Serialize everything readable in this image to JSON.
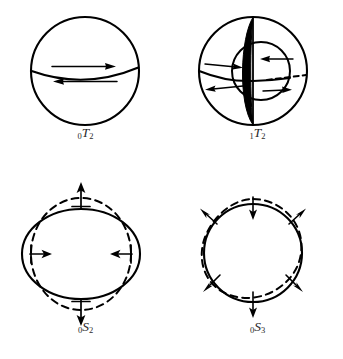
{
  "figure": {
    "background_color": "#ffffff",
    "stroke_color": "#000000",
    "label_color": "#2b2b2b",
    "width": 343,
    "height": 359
  },
  "panels": [
    {
      "id": "0T2",
      "mode_type": "toroidal",
      "overtone_number": "0",
      "symbol": "T",
      "angular_order": "2",
      "label_full": "₀T₂",
      "description": "Sphere with equatorial nodal line; upper hemisphere twists east, lower hemisphere twists west",
      "arrows": [
        {
          "name": "upper-hemisphere-arrow",
          "direction": "right"
        },
        {
          "name": "lower-hemisphere-arrow",
          "direction": "left"
        }
      ],
      "features": [
        "outer-sphere-outline",
        "equator-curve"
      ]
    },
    {
      "id": "1T2",
      "mode_type": "toroidal",
      "overtone_number": "1",
      "symbol": "T",
      "angular_order": "2",
      "label_full": "₁T₂",
      "description": "Sphere with one internal nodal surface shown as black lune; outer shell and inner core twist in opposite senses",
      "arrows": [
        {
          "name": "outer-upper-arrow",
          "direction": "right"
        },
        {
          "name": "outer-lower-arrow",
          "direction": "left"
        },
        {
          "name": "inner-upper-arrow",
          "direction": "left"
        },
        {
          "name": "inner-lower-arrow",
          "direction": "right"
        }
      ],
      "features": [
        "outer-sphere-outline",
        "black-lune-nodal-surface",
        "inner-circle",
        "equator-curve",
        "hidden-equator-dashed"
      ]
    },
    {
      "id": "0S2",
      "mode_type": "spheroidal",
      "overtone_number": "0",
      "symbol": "S",
      "angular_order": "2",
      "label_full": "₀S₂",
      "description": "Football mode: solid oblate outline alternates with dashed prolate outline; motion outward at poles and inward at equator",
      "arrows": [
        {
          "name": "top-arrow",
          "direction": "outward-up"
        },
        {
          "name": "bottom-arrow",
          "direction": "outward-down"
        },
        {
          "name": "left-arrow",
          "direction": "inward-right"
        },
        {
          "name": "right-arrow",
          "direction": "inward-left"
        }
      ],
      "features": [
        "solid-oblate-ellipse",
        "dashed-prolate-ellipse"
      ]
    },
    {
      "id": "0S3",
      "mode_type": "spheroidal",
      "overtone_number": "0",
      "symbol": "S",
      "angular_order": "3",
      "label_full": "₀S₃",
      "description": "Degree-three spheroidal mode: solid circle with dashed three-lobed deformed outline and six alternating radial arrows",
      "arrows": [
        {
          "name": "top-arrow",
          "direction": "inward"
        },
        {
          "name": "upper-left-arrow",
          "direction": "outward"
        },
        {
          "name": "upper-right-arrow",
          "direction": "outward"
        },
        {
          "name": "lower-left-arrow",
          "direction": "outward"
        },
        {
          "name": "lower-right-arrow",
          "direction": "outward"
        },
        {
          "name": "bottom-arrow",
          "direction": "outward"
        }
      ],
      "features": [
        "solid-circle",
        "dashed-deformed-outline"
      ]
    }
  ]
}
